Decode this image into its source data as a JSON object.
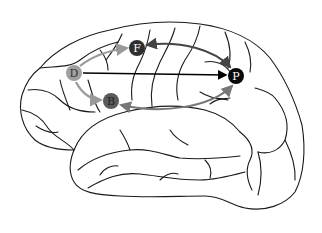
{
  "diagram": {
    "type": "brain-lateral-view-network",
    "nodes": [
      {
        "id": "D",
        "label": "D",
        "x": 74,
        "y": 73,
        "fill": "#a0a0a0",
        "text_color": "#333333"
      },
      {
        "id": "F",
        "label": "F",
        "x": 137,
        "y": 48,
        "fill": "#2f2f2f",
        "text_color": "#ffffff"
      },
      {
        "id": "B",
        "label": "B",
        "x": 111,
        "y": 101,
        "fill": "#5a5a5a",
        "text_color": "#222222"
      },
      {
        "id": "P",
        "label": "P",
        "x": 236,
        "y": 76,
        "fill": "#0a0a0a",
        "text_color": "#ffffff"
      }
    ],
    "edges": [
      {
        "from": "D",
        "to": "P",
        "style": "straight",
        "color": "#000000"
      },
      {
        "from": "D",
        "to": "F",
        "style": "curved",
        "color": "#9a9a9a"
      },
      {
        "from": "D",
        "to": "B",
        "style": "curved",
        "color": "#9a9a9a"
      },
      {
        "from": "P",
        "to": "F",
        "style": "curved-bidirectional",
        "color": "#444444"
      },
      {
        "from": "P",
        "to": "B",
        "style": "curved-bidirectional",
        "color": "#777777"
      }
    ],
    "colors": {
      "outline": "#1a1a1a",
      "background": "#ffffff"
    }
  }
}
